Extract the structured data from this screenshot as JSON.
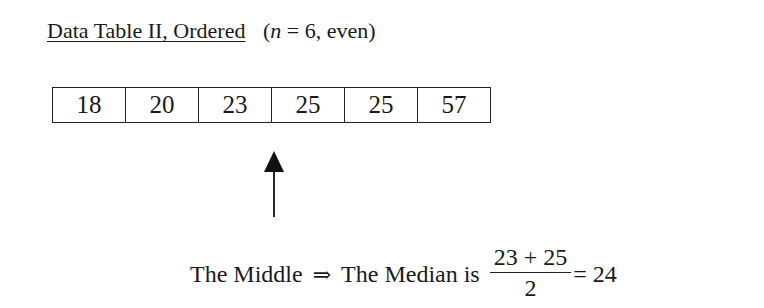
{
  "title": {
    "label": "Data Table II, Ordered",
    "n_var": "n",
    "n_expr": " = 6, even)",
    "open_paren": "("
  },
  "table": {
    "values": [
      "18",
      "20",
      "23",
      "25",
      "25",
      "57"
    ]
  },
  "arrow": {
    "icon": "up-arrow-icon",
    "points_between": [
      "23",
      "25"
    ]
  },
  "caption": {
    "middle_text": "The Middle",
    "implies": "⇒",
    "median_text": "The Median is",
    "numerator": "23 + 25",
    "denominator": "2",
    "result": "= 24"
  }
}
